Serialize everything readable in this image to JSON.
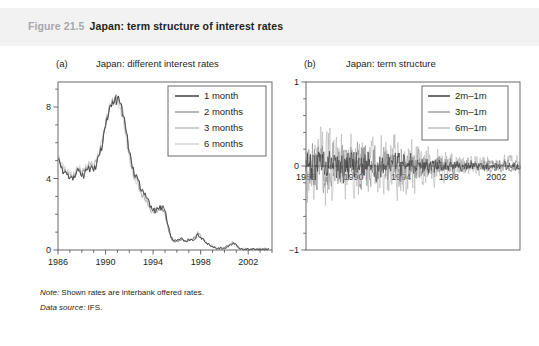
{
  "caption": {
    "figure_number": "Figure 21.5",
    "title": "Japan: term structure of interest rates"
  },
  "notes": [
    {
      "lead": "Note:",
      "text": " Shown rates are interbank offered rates."
    },
    {
      "lead": "Data source:",
      "text": " IFS."
    }
  ],
  "colors": {
    "band": "#f2f2f2",
    "fig_number": "#a6a8ab",
    "text": "#231f20",
    "axis": "#58595b",
    "series_1": "#3f3f3f",
    "series_2": "#7d7d7d",
    "series_3": "#a9a9a9",
    "series_4": "#c6c6c6"
  },
  "chart_data": [
    {
      "type": "line",
      "panel_tag": "(a)",
      "title": "Japan: different interest rates",
      "xlabel": "",
      "ylabel": "",
      "xlim": [
        1986,
        2004
      ],
      "ylim": [
        0,
        9.4
      ],
      "xticks": [
        1986,
        1990,
        1994,
        1998,
        2002
      ],
      "yticks": [
        0,
        4,
        8
      ],
      "y_minor_step": 1,
      "x_minor_step": 1,
      "grid": false,
      "legend_position": "top-right",
      "legend": [
        "1 month",
        "2 months",
        "3 months",
        "6 months"
      ],
      "x": [
        1986.0,
        1986.25,
        1986.5,
        1986.75,
        1987.0,
        1987.25,
        1987.5,
        1987.75,
        1988.0,
        1988.25,
        1988.5,
        1988.75,
        1989.0,
        1989.25,
        1989.5,
        1989.75,
        1990.0,
        1990.25,
        1990.5,
        1990.75,
        1991.0,
        1991.25,
        1991.5,
        1991.75,
        1992.0,
        1992.25,
        1992.5,
        1992.75,
        1993.0,
        1993.25,
        1993.5,
        1993.75,
        1994.0,
        1994.25,
        1994.5,
        1994.75,
        1995.0,
        1995.25,
        1995.5,
        1995.75,
        1996.0,
        1996.25,
        1996.5,
        1996.75,
        1997.0,
        1997.25,
        1997.5,
        1997.75,
        1998.0,
        1998.25,
        1998.5,
        1998.75,
        1999.0,
        1999.25,
        1999.5,
        1999.75,
        2000.0,
        2000.25,
        2000.5,
        2000.75,
        2001.0,
        2001.25,
        2001.5,
        2001.75,
        2002.0,
        2002.25,
        2002.5,
        2002.75,
        2003.0,
        2003.25,
        2003.5,
        2003.75
      ],
      "series": [
        {
          "name": "1 month",
          "values": [
            5.1,
            4.6,
            4.3,
            4.2,
            4.0,
            3.9,
            4.2,
            4.4,
            4.1,
            4.3,
            4.5,
            4.6,
            4.4,
            4.8,
            5.3,
            5.9,
            6.9,
            7.6,
            8.0,
            8.3,
            8.5,
            8.2,
            7.5,
            6.6,
            5.5,
            4.6,
            4.1,
            3.9,
            3.3,
            3.1,
            2.9,
            2.4,
            2.2,
            2.2,
            2.3,
            2.4,
            2.2,
            1.4,
            0.7,
            0.5,
            0.5,
            0.6,
            0.6,
            0.5,
            0.6,
            0.6,
            0.6,
            0.9,
            0.7,
            0.6,
            0.4,
            0.3,
            0.2,
            0.1,
            0.1,
            0.1,
            0.1,
            0.2,
            0.3,
            0.4,
            0.3,
            0.1,
            0.05,
            0.05,
            0.05,
            0.05,
            0.05,
            0.05,
            0.05,
            0.05,
            0.05,
            0.05
          ]
        },
        {
          "name": "2 months",
          "values": [
            5.15,
            4.65,
            4.35,
            4.25,
            4.05,
            3.95,
            4.25,
            4.45,
            4.15,
            4.35,
            4.55,
            4.65,
            4.45,
            4.85,
            5.35,
            5.95,
            6.95,
            7.65,
            8.05,
            8.35,
            8.5,
            8.15,
            7.45,
            6.5,
            5.4,
            4.55,
            4.05,
            3.85,
            3.25,
            3.05,
            2.85,
            2.35,
            2.2,
            2.2,
            2.3,
            2.4,
            2.15,
            1.35,
            0.7,
            0.5,
            0.5,
            0.6,
            0.6,
            0.5,
            0.6,
            0.6,
            0.65,
            0.95,
            0.72,
            0.6,
            0.4,
            0.3,
            0.2,
            0.12,
            0.1,
            0.1,
            0.12,
            0.22,
            0.32,
            0.42,
            0.3,
            0.1,
            0.06,
            0.06,
            0.06,
            0.06,
            0.06,
            0.06,
            0.06,
            0.06,
            0.06,
            0.06
          ]
        },
        {
          "name": "3 months",
          "values": [
            5.2,
            4.7,
            4.4,
            4.3,
            4.1,
            4.0,
            4.3,
            4.5,
            4.2,
            4.4,
            4.6,
            4.7,
            4.5,
            4.9,
            5.4,
            6.0,
            7.0,
            7.7,
            8.1,
            8.4,
            8.45,
            8.1,
            7.4,
            6.4,
            5.3,
            4.5,
            4.0,
            3.8,
            3.2,
            3.0,
            2.8,
            2.3,
            2.2,
            2.2,
            2.3,
            2.4,
            2.1,
            1.3,
            0.7,
            0.5,
            0.5,
            0.6,
            0.6,
            0.5,
            0.6,
            0.6,
            0.7,
            1.0,
            0.75,
            0.6,
            0.4,
            0.3,
            0.2,
            0.14,
            0.12,
            0.12,
            0.14,
            0.24,
            0.34,
            0.44,
            0.3,
            0.1,
            0.07,
            0.07,
            0.07,
            0.07,
            0.07,
            0.07,
            0.07,
            0.07,
            0.07,
            0.07
          ]
        },
        {
          "name": "6 months",
          "values": [
            5.3,
            4.8,
            4.5,
            4.4,
            4.2,
            4.1,
            4.4,
            4.6,
            4.3,
            4.5,
            4.7,
            4.8,
            4.6,
            5.0,
            5.5,
            6.1,
            7.1,
            7.8,
            8.15,
            8.4,
            8.4,
            8.0,
            7.3,
            6.3,
            5.2,
            4.45,
            3.95,
            3.75,
            3.15,
            2.95,
            2.75,
            2.25,
            2.2,
            2.2,
            2.3,
            2.4,
            2.05,
            1.25,
            0.7,
            0.5,
            0.5,
            0.6,
            0.6,
            0.5,
            0.6,
            0.6,
            0.75,
            1.05,
            0.8,
            0.6,
            0.4,
            0.3,
            0.22,
            0.16,
            0.14,
            0.14,
            0.16,
            0.26,
            0.36,
            0.46,
            0.3,
            0.12,
            0.08,
            0.08,
            0.08,
            0.08,
            0.08,
            0.08,
            0.08,
            0.08,
            0.08,
            0.08
          ]
        }
      ]
    },
    {
      "type": "line",
      "panel_tag": "(b)",
      "title": "Japan: term structure",
      "xlabel": "",
      "ylabel": "",
      "xlim": [
        1986,
        2004
      ],
      "ylim": [
        -1,
        1
      ],
      "xticks": [
        1986,
        1990,
        1994,
        1998,
        2002
      ],
      "yticks": [
        -1,
        0,
        1
      ],
      "y_minor_step": 0.2,
      "x_minor_step": 1,
      "grid": false,
      "legend_position": "top-right",
      "legend": [
        "2m–1m",
        "3m–1m",
        "6m–1m"
      ],
      "description": "High-frequency interest-rate spreads fluctuating about zero, with largest volatility (roughly −0.5 to +0.6) between 1986 and 1994 and progressively smaller oscillations after 1995.",
      "series": [
        {
          "name": "2m–1m",
          "amplitude_early": 0.18,
          "amplitude_late": 0.05
        },
        {
          "name": "3m–1m",
          "amplitude_early": 0.28,
          "amplitude_late": 0.08
        },
        {
          "name": "6m–1m",
          "amplitude_early": 0.45,
          "amplitude_late": 0.12
        }
      ]
    }
  ]
}
